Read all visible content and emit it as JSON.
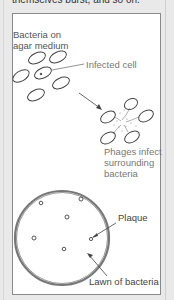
{
  "header": {
    "text": "themselves burst, and so on."
  },
  "diagram": {
    "labels": {
      "bacteria_on_agar_line1": "Bacteria on",
      "bacteria_on_agar_line2": "agar medium",
      "infected_cell": "Infected cell",
      "phages_line1": "Phages infect",
      "phages_line2": "surrounding",
      "phages_line3": "bacteria",
      "plaque": "Plaque",
      "lawn": "Lawn of bacteria"
    },
    "colors": {
      "background": "#e9e9e9",
      "panel": "#ffffff",
      "border": "#8a8a8a",
      "ink": "#444444",
      "label": "#555555"
    }
  }
}
